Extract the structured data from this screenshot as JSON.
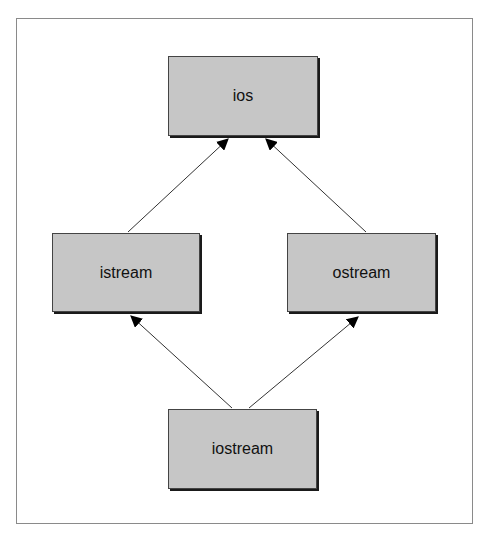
{
  "diagram": {
    "type": "class-hierarchy",
    "nodes": [
      {
        "id": "ios",
        "label": "ios"
      },
      {
        "id": "istream",
        "label": "istream"
      },
      {
        "id": "ostream",
        "label": "ostream"
      },
      {
        "id": "iostream",
        "label": "iostream"
      }
    ],
    "edges": [
      {
        "from": "istream",
        "to": "ios"
      },
      {
        "from": "ostream",
        "to": "ios"
      },
      {
        "from": "iostream",
        "to": "istream"
      },
      {
        "from": "iostream",
        "to": "ostream"
      }
    ],
    "colors": {
      "node_fill": "#c6c6c6",
      "node_border": "#444444",
      "edge": "#333333",
      "frame": "#8a8a8a"
    }
  }
}
